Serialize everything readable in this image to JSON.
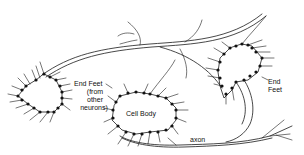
{
  "diagram": {
    "labels": {
      "end_feet_left": "End Feet",
      "end_feet_left_sub1": "(from",
      "end_feet_left_sub2": "other",
      "end_feet_left_sub3": "neurons)",
      "cell_body": "Cell Body",
      "end_feet_right_1": "End",
      "end_feet_right_2": "Feet",
      "axon": "axon"
    },
    "colors": {
      "line": "#1a1a1a",
      "background": "#ffffff"
    }
  }
}
